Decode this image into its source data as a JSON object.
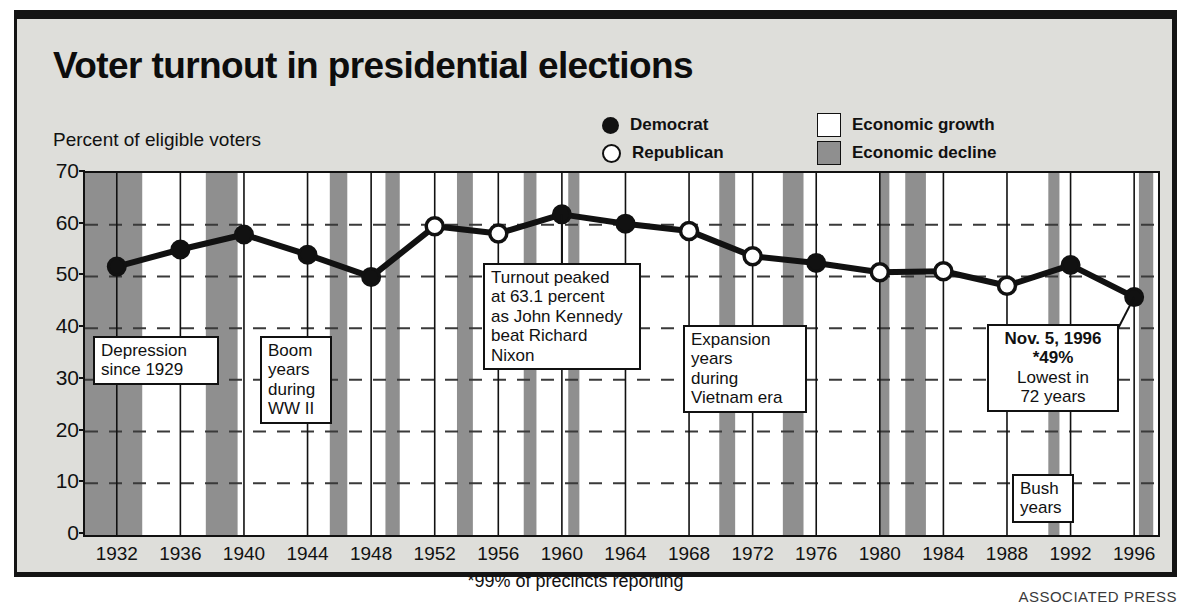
{
  "title": "Voter turnout in presidential elections",
  "subtitle": "Percent of eligible voters",
  "legend": {
    "democrat": "Democrat",
    "republican": "Republican",
    "growth": "Economic growth",
    "decline": "Economic decline"
  },
  "footnote": "*99% of precincts reporting",
  "credit": "ASSOCIATED PRESS",
  "callouts": {
    "depression": {
      "l1": "Depression",
      "l2": "since 1929"
    },
    "boom": {
      "l1": "Boom",
      "l2": "years",
      "l3": "during",
      "l4": "WW II"
    },
    "peak": {
      "l1": "Turnout peaked",
      "l2": "at 63.1 percent",
      "l3": "as John Kennedy",
      "l4": "beat Richard",
      "l5": "Nixon"
    },
    "expansion": {
      "l1": "Expansion",
      "l2": "years",
      "l3": "during",
      "l4": "Vietnam era"
    },
    "latest": {
      "l1": "Nov. 5, 1996",
      "l2": "*49%",
      "l3": "Lowest in",
      "l4": "72 years"
    },
    "bush": {
      "l1": "Bush",
      "l2": "years"
    }
  },
  "colors": {
    "ink": "#111111",
    "panel_bg": "#dededa",
    "plot_bg": "#ffffff",
    "decline_band": "#8f8f8f",
    "grid": "#3a3a3a"
  },
  "chart_data": {
    "type": "line",
    "title": "Voter turnout in presidential elections",
    "xlabel": "",
    "ylabel": "Percent of eligible voters",
    "ylim": [
      0,
      70
    ],
    "yticks": [
      0,
      10,
      20,
      30,
      40,
      50,
      60,
      70
    ],
    "grid": "horizontal dashed at 10-unit intervals; vertical solid at each election year",
    "legend_position": "top-right",
    "x": [
      1932,
      1936,
      1940,
      1944,
      1948,
      1952,
      1956,
      1960,
      1964,
      1968,
      1972,
      1976,
      1980,
      1984,
      1988,
      1992,
      1996
    ],
    "categories": [
      "1932",
      "1936",
      "1940",
      "1944",
      "1948",
      "1952",
      "1956",
      "1960",
      "1964",
      "1968",
      "1972",
      "1976",
      "1980",
      "1984",
      "1988",
      "1992",
      "1996"
    ],
    "values": [
      51.9,
      55.2,
      58.1,
      54.2,
      49.9,
      59.7,
      58.3,
      62.0,
      60.2,
      58.8,
      53.9,
      52.6,
      50.8,
      51.0,
      48.2,
      52.2,
      46.0
    ],
    "point_party": [
      "Democrat",
      "Democrat",
      "Democrat",
      "Democrat",
      "Democrat",
      "Republican",
      "Republican",
      "Democrat",
      "Democrat",
      "Republican",
      "Republican",
      "Democrat",
      "Republican",
      "Republican",
      "Republican",
      "Democrat",
      "Democrat"
    ],
    "series": [
      {
        "name": "Voter turnout",
        "values": [
          51.9,
          55.2,
          58.1,
          54.2,
          49.9,
          59.7,
          58.3,
          62.0,
          60.2,
          58.8,
          53.9,
          52.6,
          50.8,
          51.0,
          48.2,
          52.2,
          46.0
        ]
      }
    ],
    "annotations": [
      {
        "text": "Depression since 1929",
        "near": 1932
      },
      {
        "text": "Boom years during WW II",
        "near": 1942
      },
      {
        "text": "Turnout peaked at 63.1 percent as John Kennedy beat Richard Nixon",
        "near": 1960,
        "value": 63.1
      },
      {
        "text": "Expansion years during Vietnam era",
        "near": 1968
      },
      {
        "text": "Nov. 5, 1996 *49% Lowest in 72 years",
        "near": 1996,
        "value": 49
      },
      {
        "text": "Bush years",
        "near": 1990
      }
    ],
    "shaded_regions": [
      {
        "label": "Economic decline",
        "from": 1930.0,
        "to": 1933.6
      },
      {
        "label": "Economic decline",
        "from": 1937.6,
        "to": 1939.6
      },
      {
        "label": "Economic decline",
        "from": 1945.4,
        "to": 1946.5
      },
      {
        "label": "Economic decline",
        "from": 1948.9,
        "to": 1949.8
      },
      {
        "label": "Economic decline",
        "from": 1953.4,
        "to": 1954.4
      },
      {
        "label": "Economic decline",
        "from": 1957.6,
        "to": 1958.4
      },
      {
        "label": "Economic decline",
        "from": 1960.4,
        "to": 1961.1
      },
      {
        "label": "Economic decline",
        "from": 1969.9,
        "to": 1970.9
      },
      {
        "label": "Economic decline",
        "from": 1973.9,
        "to": 1975.2
      },
      {
        "label": "Economic decline",
        "from": 1980.0,
        "to": 1980.6
      },
      {
        "label": "Economic decline",
        "from": 1981.6,
        "to": 1982.9
      },
      {
        "label": "Economic decline",
        "from": 1990.6,
        "to": 1991.3
      },
      {
        "label": "Economic decline",
        "from": 1996.3,
        "to": 1997.2
      }
    ]
  }
}
